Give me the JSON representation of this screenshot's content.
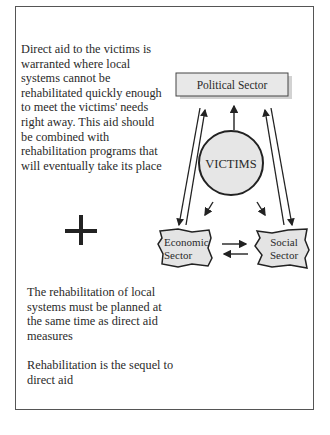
{
  "left_text": {
    "direct_aid": "Direct aid to the victims is warranted where local systems cannot be rehabilitated quickly enough to meet the victims' needs right away.  This aid should be combined with rehabilitation programs that will eventually take its place",
    "rehab_planning": "The rehabilitation  of local systems must be planned at the same time as direct aid measures",
    "rehab_sequel": "Rehabilitation is the sequel to direct aid"
  },
  "symbols": {
    "plus": "plus-sign"
  },
  "diagram": {
    "nodes": {
      "political": "Political Sector",
      "victims": "VICTIMS",
      "economic_line1": "Economic",
      "economic_line2": "Sector",
      "social_line1": "Social",
      "social_line2": "Sector"
    },
    "colors": {
      "node_fill": "#e6e6e6",
      "stroke": "#222222"
    }
  }
}
